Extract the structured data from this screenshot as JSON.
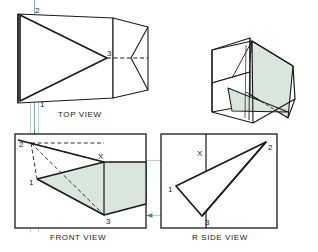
{
  "drawing": {
    "title": "Orthographic projection of an oblique plane",
    "views": [
      {
        "key": "top",
        "label": "TOP VIEW"
      },
      {
        "key": "front",
        "label": "FRONT VIEW"
      },
      {
        "key": "side",
        "label": "R SIDE VIEW"
      }
    ],
    "point_labels": {
      "one": "1",
      "two": "2",
      "three": "3",
      "x": "X"
    },
    "labels": {
      "top_view": "TOP VIEW",
      "front_view": "FRONT VIEW",
      "side_view": "R SIDE VIEW",
      "caption": ""
    },
    "colors": {
      "line": "#1a1a1a",
      "shade": "#d8e6de",
      "shade_dark": "#cfe0d6",
      "projection": "#4f9e86",
      "projection_light": "#a8cfc2",
      "caption": "#cfcfcf",
      "paper": "#ffffff"
    },
    "annotations": {
      "top_view_points": [
        "2",
        "3",
        "1"
      ],
      "front_view_points": [
        "2",
        "X",
        "1",
        "3"
      ],
      "side_view_points": [
        "X",
        "2",
        "1",
        "3"
      ]
    }
  }
}
